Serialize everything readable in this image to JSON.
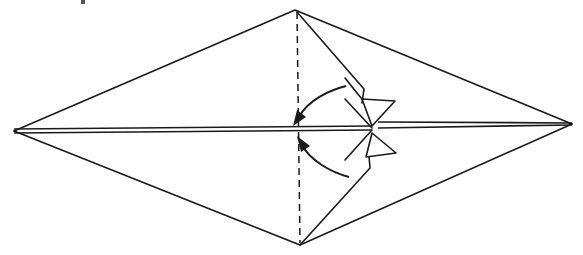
{
  "diagram": {
    "type": "origami-fold-step",
    "colors": {
      "line": "#1a1a1a",
      "background": "#ffffff"
    },
    "vertices": {
      "left": [
        14,
        131
      ],
      "right": [
        572,
        124
      ],
      "top": [
        295,
        10
      ],
      "bottom": [
        300,
        245
      ]
    },
    "symbols": [
      {
        "name": "valley-fold-line",
        "style": "dashed",
        "from": [
          297,
          12
        ],
        "to": [
          300,
          242
        ]
      },
      {
        "name": "fold-arrow-upper",
        "direction": "left-downward curve"
      },
      {
        "name": "fold-arrow-lower",
        "direction": "left-upward curve"
      },
      {
        "name": "upper-flap-triangle"
      },
      {
        "name": "lower-flap-triangle"
      }
    ],
    "text": []
  }
}
